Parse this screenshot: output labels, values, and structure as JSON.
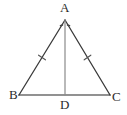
{
  "figure": {
    "kind": "geometry-diagram",
    "background_color": "#ffffff",
    "stroke_color": "#3a3a3a",
    "base_stroke_color": "#6e6e6e",
    "label_color": "#2b2b2b",
    "vertices": [
      {
        "id": "A",
        "label": "A",
        "x": 65,
        "y": 20
      },
      {
        "id": "B",
        "label": "B",
        "x": 19,
        "y": 95
      },
      {
        "id": "C",
        "label": "C",
        "x": 110,
        "y": 95
      },
      {
        "id": "D",
        "label": "D",
        "x": 65,
        "y": 95
      }
    ],
    "segments": [
      {
        "id": "AB",
        "from": "A",
        "to": "B",
        "tick_marks": 1
      },
      {
        "id": "AC",
        "from": "A",
        "to": "C",
        "tick_marks": 1
      },
      {
        "id": "BC",
        "from": "B",
        "to": "C",
        "tick_marks": 0
      },
      {
        "id": "AD",
        "from": "A",
        "to": "D",
        "tick_marks": 0
      }
    ],
    "angle_marks": [
      {
        "id": "BAD",
        "at": "A",
        "marks": 1
      },
      {
        "id": "DAC",
        "at": "A",
        "marks": 1
      }
    ]
  }
}
